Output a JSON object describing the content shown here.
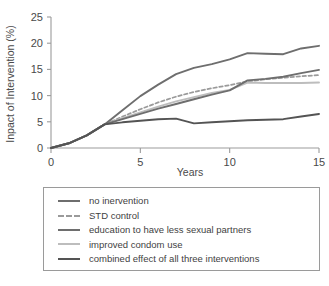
{
  "chart_data": {
    "type": "line",
    "title": "",
    "xlabel": "Years",
    "ylabel": "Inpact of Intervention (%)",
    "xlim": [
      0,
      15
    ],
    "ylim": [
      0,
      25
    ],
    "xticks": [
      "0",
      "5",
      "10",
      "15"
    ],
    "yticks": [
      "0",
      "5",
      "10",
      "15",
      "20",
      "25"
    ],
    "grid": false,
    "legend_position": "below-plot",
    "x": [
      0,
      1,
      2,
      3,
      4,
      5,
      6,
      7,
      8,
      9,
      10,
      11,
      12,
      13,
      14,
      15
    ],
    "series": [
      {
        "name": "no inervention",
        "color": "#6e6e6e",
        "style": "solid",
        "width": 1.9,
        "values": [
          0,
          0.9,
          2.4,
          4.5,
          7.2,
          9.9,
          12.1,
          14.1,
          15.3,
          16.0,
          16.9,
          18.1,
          18.0,
          17.9,
          19.0,
          19.5
        ]
      },
      {
        "name": "STD control",
        "color": "#9a9a9a",
        "style": "dashed",
        "width": 1.7,
        "values": [
          0,
          0.9,
          2.4,
          4.5,
          6.0,
          7.4,
          8.7,
          9.8,
          10.7,
          11.4,
          12.0,
          12.7,
          13.1,
          13.4,
          13.7,
          13.9
        ]
      },
      {
        "name": "education to have less sexual partners",
        "color": "#6e6e6e",
        "style": "solid",
        "width": 1.9,
        "values": [
          0,
          0.9,
          2.4,
          4.5,
          5.5,
          6.5,
          7.5,
          8.4,
          9.3,
          10.2,
          11.0,
          12.9,
          13.2,
          13.6,
          14.3,
          14.9
        ]
      },
      {
        "name": "improved condom use",
        "color": "#bdbdbd",
        "style": "solid",
        "width": 1.9,
        "values": [
          0,
          0.9,
          2.4,
          4.5,
          5.7,
          6.8,
          7.9,
          8.9,
          9.7,
          10.5,
          11.1,
          12.5,
          12.4,
          12.4,
          12.4,
          12.5
        ]
      },
      {
        "name": "combined effect of all three interventions",
        "color": "#545454",
        "style": "solid",
        "width": 1.9,
        "values": [
          0,
          0.9,
          2.4,
          4.5,
          4.9,
          5.2,
          5.5,
          5.6,
          4.7,
          4.9,
          5.1,
          5.3,
          5.4,
          5.5,
          6.0,
          6.5
        ]
      }
    ]
  },
  "legend": {
    "items": [
      {
        "label": "no inervention"
      },
      {
        "label": "STD control"
      },
      {
        "label": "education to have less sexual partners"
      },
      {
        "label": "improved condom use"
      },
      {
        "label": "combined effect of all three interventions"
      }
    ]
  }
}
